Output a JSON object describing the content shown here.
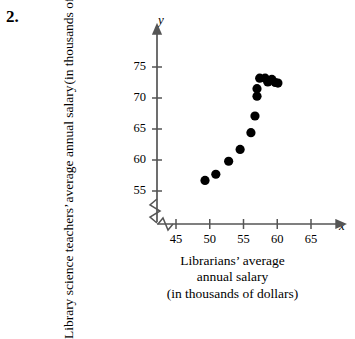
{
  "problem": {
    "number": "2."
  },
  "chart_data": {
    "type": "scatter",
    "title": "",
    "xlabel_lines": [
      "Librarians’ average",
      "annual salary",
      "(in thousands of dollars)"
    ],
    "ylabel_lines": [
      "Library science teachers’",
      "average annual salary",
      "(in thousands of dollars)"
    ],
    "x_axis_letter": "x",
    "y_axis_letter": "y",
    "xticks": [
      45,
      50,
      55,
      60,
      65
    ],
    "xtick_labels": [
      "45",
      "50",
      "55",
      "60",
      "65"
    ],
    "yticks": [
      55,
      60,
      65,
      70,
      75
    ],
    "ytick_labels": [
      "55",
      "60",
      "65",
      "70",
      "75"
    ],
    "xlim": [
      42.0,
      67.5
    ],
    "ylim": [
      53.0,
      77.0
    ],
    "x_axis_break": true,
    "y_axis_break": true,
    "grid": false,
    "legend": null,
    "marker_color": "#000000",
    "marker_size": 4.6,
    "points": [
      {
        "x": 49.3,
        "y": 56.7
      },
      {
        "x": 50.9,
        "y": 57.7
      },
      {
        "x": 52.8,
        "y": 59.8
      },
      {
        "x": 54.5,
        "y": 61.7
      },
      {
        "x": 56.1,
        "y": 64.4
      },
      {
        "x": 56.7,
        "y": 67.1
      },
      {
        "x": 57.0,
        "y": 71.5
      },
      {
        "x": 57.0,
        "y": 70.3
      },
      {
        "x": 57.4,
        "y": 73.2
      },
      {
        "x": 58.2,
        "y": 73.2
      },
      {
        "x": 58.6,
        "y": 72.6
      },
      {
        "x": 59.2,
        "y": 73.0
      },
      {
        "x": 59.7,
        "y": 72.5
      },
      {
        "x": 60.1,
        "y": 72.4
      }
    ]
  },
  "colors": {
    "axis": "#555555",
    "marker": "#000000",
    "text": "#000000",
    "background": "#ffffff"
  }
}
